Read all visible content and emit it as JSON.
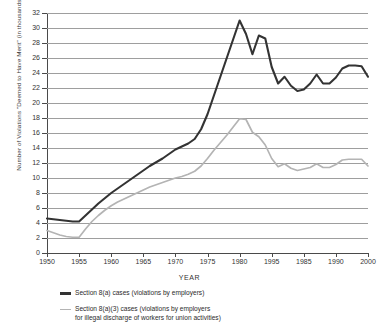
{
  "chart_data": {
    "type": "line",
    "title": "",
    "xlabel": "YEAR",
    "ylabel": "Number of Violations \"Deemed to Have Merit\" (in thousands)",
    "xlim": [
      1950,
      2000
    ],
    "ylim": [
      0,
      32
    ],
    "grid": true,
    "legend_position": "below",
    "ytick_labels": [
      "0",
      "2",
      "4",
      "6",
      "8",
      "10",
      "12",
      "14",
      "16",
      "18",
      "20",
      "22",
      "24",
      "26",
      "28",
      "30",
      "32"
    ],
    "ytick_values": [
      0,
      2,
      4,
      6,
      8,
      10,
      12,
      14,
      16,
      18,
      20,
      22,
      24,
      26,
      28,
      30,
      32
    ],
    "xtick_labels": [
      "1950",
      "1955",
      "1960",
      "1965",
      "1970",
      "1975",
      "1980",
      "1995",
      "1985",
      "1990",
      "2000"
    ],
    "xtick_values": [
      1950,
      1955,
      1960,
      1965,
      1970,
      1975,
      1980,
      1985,
      1990,
      1995,
      2000
    ],
    "series": [
      {
        "name": "Section 8(a) cases (violations by employers)",
        "color": "#333333",
        "x": [
          1950,
          1951,
          1952,
          1953,
          1954,
          1955,
          1956,
          1957,
          1958,
          1959,
          1960,
          1961,
          1962,
          1963,
          1964,
          1965,
          1966,
          1967,
          1968,
          1969,
          1970,
          1971,
          1972,
          1973,
          1974,
          1975,
          1976,
          1977,
          1978,
          1979,
          1980,
          1981,
          1982,
          1983,
          1984,
          1985,
          1986,
          1987,
          1988,
          1989,
          1990,
          1991,
          1992,
          1993,
          1994,
          1995,
          1996,
          1997,
          1998,
          1999,
          2000
        ],
        "values": [
          4.6,
          4.5,
          4.4,
          4.3,
          4.2,
          4.2,
          5.0,
          5.8,
          6.6,
          7.3,
          8.0,
          8.6,
          9.2,
          9.8,
          10.4,
          11.0,
          11.6,
          12.1,
          12.6,
          13.2,
          13.8,
          14.2,
          14.6,
          15.2,
          16.5,
          18.5,
          21.0,
          23.5,
          26.0,
          28.5,
          31.0,
          29.2,
          26.5,
          29.0,
          28.6,
          24.8,
          22.6,
          23.5,
          22.3,
          21.6,
          21.8,
          22.6,
          23.8,
          22.6,
          22.6,
          23.4,
          24.6,
          25.0,
          25.0,
          24.9,
          23.5
        ]
      },
      {
        "name": "Section 8(a)(3) cases (violations by employers for illegal discharge of workers for union activities)",
        "color": "#b4b4b4",
        "x": [
          1950,
          1951,
          1952,
          1953,
          1954,
          1955,
          1956,
          1957,
          1958,
          1959,
          1960,
          1961,
          1962,
          1963,
          1964,
          1965,
          1966,
          1967,
          1968,
          1969,
          1970,
          1971,
          1972,
          1973,
          1974,
          1975,
          1976,
          1977,
          1978,
          1979,
          1980,
          1981,
          1982,
          1983,
          1984,
          1985,
          1986,
          1987,
          1988,
          1989,
          1990,
          1991,
          1992,
          1993,
          1994,
          1995,
          1996,
          1997,
          1998,
          1999,
          2000
        ],
        "values": [
          3.0,
          2.7,
          2.4,
          2.2,
          2.1,
          2.1,
          3.2,
          4.2,
          5.0,
          5.7,
          6.3,
          6.8,
          7.2,
          7.6,
          8.0,
          8.4,
          8.8,
          9.1,
          9.4,
          9.7,
          10.0,
          10.2,
          10.5,
          10.9,
          11.6,
          12.6,
          13.7,
          14.7,
          15.7,
          16.8,
          17.9,
          17.8,
          16.1,
          15.5,
          14.4,
          12.6,
          11.5,
          11.9,
          11.3,
          11.0,
          11.2,
          11.4,
          11.9,
          11.4,
          11.4,
          11.8,
          12.4,
          12.5,
          12.5,
          12.5,
          11.6
        ]
      }
    ]
  },
  "legend": {
    "items": [
      {
        "label": "Section 8(a) cases (violations by employers)"
      },
      {
        "label": "Section 8(a)(3) cases (violations by employers\nfor illegal discharge of workers for union activities)"
      }
    ]
  }
}
